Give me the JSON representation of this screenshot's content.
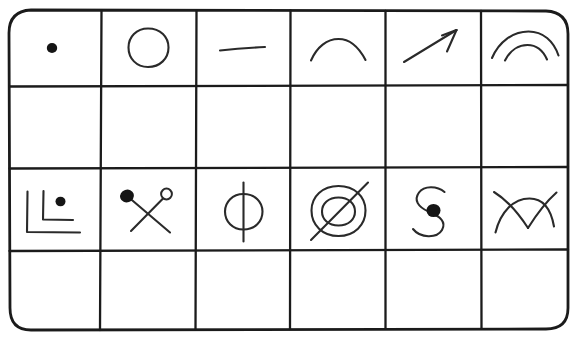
{
  "image": {
    "title": "Hand-drawn symbol grid",
    "description": "A hand-drawn rounded-rectangle table of 6 columns by 4 rows containing simple ink glyphs",
    "medium": "pen and ink line drawing on white paper",
    "width": 577,
    "height": 340,
    "ink_color": "#1b1b1b",
    "glyph_color": "#2a2a2a",
    "paper_color": "#ffffff"
  },
  "grid": {
    "columns": 6,
    "rows": 4,
    "corner_style": "rounded",
    "corner_radius": 22,
    "border_width": 2.6,
    "inner_line_width": 2.2,
    "column_edges": [
      9,
      101,
      196,
      290,
      385,
      481,
      568
    ],
    "row_edges": [
      10,
      86,
      168,
      250,
      330
    ]
  },
  "cells": [
    {
      "row": 1,
      "column": 1,
      "name": "dot",
      "label": "filled dot",
      "empty": false
    },
    {
      "row": 1,
      "column": 2,
      "name": "circle",
      "label": "hollow circle",
      "empty": false
    },
    {
      "row": 1,
      "column": 3,
      "name": "horizontal-dash",
      "label": "horizontal line segment",
      "empty": false
    },
    {
      "row": 1,
      "column": 4,
      "name": "arc",
      "label": "single upward arc",
      "empty": false
    },
    {
      "row": 1,
      "column": 5,
      "name": "arrow",
      "label": "arrow pointing up-right",
      "empty": false
    },
    {
      "row": 1,
      "column": 6,
      "name": "double-arc",
      "label": "two nested upward arcs",
      "empty": false
    },
    {
      "row": 2,
      "column": 1,
      "name": "blank",
      "label": "",
      "empty": true
    },
    {
      "row": 2,
      "column": 2,
      "name": "blank",
      "label": "",
      "empty": true
    },
    {
      "row": 2,
      "column": 3,
      "name": "blank",
      "label": "",
      "empty": true
    },
    {
      "row": 2,
      "column": 4,
      "name": "blank",
      "label": "",
      "empty": true
    },
    {
      "row": 2,
      "column": 5,
      "name": "blank",
      "label": "",
      "empty": true
    },
    {
      "row": 2,
      "column": 6,
      "name": "blank",
      "label": "",
      "empty": true
    },
    {
      "row": 3,
      "column": 1,
      "name": "nested-corners-with-dot",
      "label": "two nested L-shaped corner brackets with a filled dot",
      "empty": false
    },
    {
      "row": 3,
      "column": 2,
      "name": "crossed-pins",
      "label": "two crossed pins, one filled head and one hollow head",
      "empty": false
    },
    {
      "row": 3,
      "column": 3,
      "name": "phi",
      "label": "circle bisected by a vertical line",
      "empty": false
    },
    {
      "row": 3,
      "column": 4,
      "name": "concentric-circles-with-slash",
      "label": "two concentric circles crossed by a diagonal line",
      "empty": false
    },
    {
      "row": 3,
      "column": 5,
      "name": "s-curve-with-dot",
      "label": "S-shaped curve with a filled dot at its center",
      "empty": false
    },
    {
      "row": 3,
      "column": 6,
      "name": "crossing-arcs",
      "label": "two arcs crossing to form a V shape",
      "empty": false
    },
    {
      "row": 4,
      "column": 1,
      "name": "blank",
      "label": "",
      "empty": true
    },
    {
      "row": 4,
      "column": 2,
      "name": "blank",
      "label": "",
      "empty": true
    },
    {
      "row": 4,
      "column": 3,
      "name": "blank",
      "label": "",
      "empty": true
    },
    {
      "row": 4,
      "column": 4,
      "name": "blank",
      "label": "",
      "empty": true
    },
    {
      "row": 4,
      "column": 5,
      "name": "blank",
      "label": "",
      "empty": true
    },
    {
      "row": 4,
      "column": 6,
      "name": "blank",
      "label": "",
      "empty": true
    }
  ]
}
